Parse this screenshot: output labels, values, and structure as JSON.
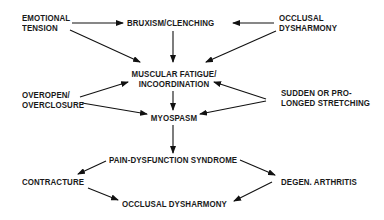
{
  "diagram": {
    "nodes": {
      "emotional_tension": [
        "EMOTIONAL",
        "TENSION"
      ],
      "bruxism": [
        "BRUXISM/CLENCHING"
      ],
      "occlusal_top": [
        "OCCLUSAL",
        "DYSHARMONY"
      ],
      "muscular_fatigue": [
        "MUSCULAR FATIGUE/",
        "INCOORDINATION"
      ],
      "overopen": [
        "OVEROPEN/",
        "OVERCLOSURE"
      ],
      "sudden_stretching": [
        "SUDDEN OR PRO-",
        "LONGED STRETCHING"
      ],
      "myospasm": [
        "MYOSPASM"
      ],
      "pain_dysfunction": [
        "PAIN-DYSFUNCTION SYNDROME"
      ],
      "contracture": [
        "CONTRACTURE"
      ],
      "degen_arthritis": [
        "DEGEN. ARTHRITIS"
      ],
      "occlusal_bottom": [
        "OCCLUSAL DYSHARMONY"
      ]
    },
    "edges": [
      {
        "from": "emotional_tension",
        "to": "bruxism"
      },
      {
        "from": "occlusal_top",
        "to": "bruxism"
      },
      {
        "from": "emotional_tension",
        "to": "muscular_fatigue"
      },
      {
        "from": "bruxism",
        "to": "muscular_fatigue"
      },
      {
        "from": "occlusal_top",
        "to": "muscular_fatigue"
      },
      {
        "from": "overopen",
        "to": "muscular_fatigue"
      },
      {
        "from": "sudden_stretching",
        "to": "muscular_fatigue"
      },
      {
        "from": "overopen",
        "to": "myospasm"
      },
      {
        "from": "sudden_stretching",
        "to": "myospasm"
      },
      {
        "from": "muscular_fatigue",
        "to": "myospasm"
      },
      {
        "from": "myospasm",
        "to": "pain_dysfunction"
      },
      {
        "from": "pain_dysfunction",
        "to": "contracture"
      },
      {
        "from": "pain_dysfunction",
        "to": "degen_arthritis"
      },
      {
        "from": "contracture",
        "to": "occlusal_bottom"
      },
      {
        "from": "degen_arthritis",
        "to": "occlusal_bottom"
      }
    ]
  }
}
